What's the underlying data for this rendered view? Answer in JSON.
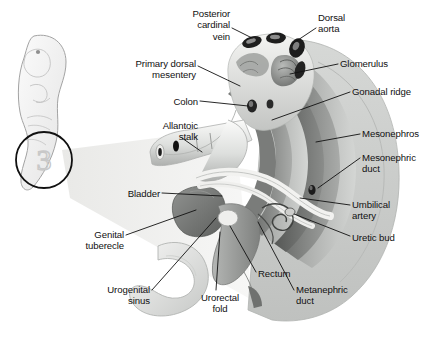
{
  "figure": {
    "background_color": "#ffffff",
    "ink_color": "#111111",
    "style": "grayscale medical illustration with leader lines"
  },
  "inset": {
    "name": "embryo-silhouette",
    "description": "whole curled embryo in pale gray, tail region circled",
    "circle_label": "3",
    "outline_color": "#9a9a9a",
    "fill_color": "#f1f1f1",
    "circle_stroke": "#111111"
  },
  "labels": [
    {
      "id": "posterior-cardinal-vein",
      "text": "Posterior\ncardinal\nvein",
      "align": "right",
      "x": 168,
      "y": 8,
      "w": 62
    },
    {
      "id": "dorsal-aorta",
      "text": "Dorsal\naorta",
      "align": "left",
      "x": 318,
      "y": 12,
      "w": 60
    },
    {
      "id": "primary-dorsal-mesentery",
      "text": "Primary dorsal\nmesentery",
      "align": "right",
      "x": 118,
      "y": 58,
      "w": 78
    },
    {
      "id": "glomerulus",
      "text": "Glomerulus",
      "align": "left",
      "x": 340,
      "y": 58,
      "w": 78
    },
    {
      "id": "gonadal-ridge",
      "text": "Gonadal ridge",
      "align": "left",
      "x": 352,
      "y": 86,
      "w": 86
    },
    {
      "id": "colon",
      "text": "Colon",
      "align": "right",
      "x": 158,
      "y": 96,
      "w": 40
    },
    {
      "id": "allantoic-stalk",
      "text": "Allantoic\nstalk",
      "align": "right",
      "x": 140,
      "y": 120,
      "w": 58
    },
    {
      "id": "mesonephros",
      "text": "Mesonephros",
      "align": "left",
      "x": 362,
      "y": 128,
      "w": 78
    },
    {
      "id": "mesonephric-duct",
      "text": "Mesonephric\nduct",
      "align": "left",
      "x": 362,
      "y": 152,
      "w": 78
    },
    {
      "id": "bladder",
      "text": "Bladder",
      "align": "right",
      "x": 110,
      "y": 188,
      "w": 50
    },
    {
      "id": "umbilical-artery",
      "text": "Umbilical\nartery",
      "align": "left",
      "x": 352,
      "y": 199,
      "w": 70
    },
    {
      "id": "genital-tuberecle",
      "text": "Genital\ntuberecle",
      "align": "right",
      "x": 58,
      "y": 229,
      "w": 66
    },
    {
      "id": "uretic-bud",
      "text": "Uretic bud",
      "align": "left",
      "x": 352,
      "y": 232,
      "w": 70
    },
    {
      "id": "rectum",
      "text": "Rectum",
      "align": "left",
      "x": 258,
      "y": 268,
      "w": 48
    },
    {
      "id": "urogenital-sinus",
      "text": "Urogenital\nsinus",
      "align": "right",
      "x": 82,
      "y": 284,
      "w": 68
    },
    {
      "id": "urorectal-fold",
      "text": "Urorectal\nfold",
      "align": "center",
      "x": 190,
      "y": 292,
      "w": 60
    },
    {
      "id": "metanephric-duct",
      "text": "Metanephric\nduct",
      "align": "left",
      "x": 296,
      "y": 284,
      "w": 76
    }
  ],
  "structures": [
    {
      "id": "body-wall",
      "name": "body-wall-outline",
      "tone": "#c9cbc9"
    },
    {
      "id": "mesonephros-bands",
      "name": "mesonephros-bands",
      "tone": "#8d8f8d"
    },
    {
      "id": "gonadal-ridge-body",
      "name": "gonadal-ridge",
      "tone": "#6f716f"
    },
    {
      "id": "dorsal-dome",
      "name": "dorsal-mesentery-dome",
      "tone": "#e8e8e6"
    },
    {
      "id": "aorta-vessels",
      "name": "dorsal-aorta-vessels",
      "tone": "#2b2b2b"
    },
    {
      "id": "gut-tube",
      "name": "colon-allantois-tube",
      "tone": "#dedede"
    },
    {
      "id": "bladder-body",
      "name": "bladder",
      "tone": "#7c7e7c"
    },
    {
      "id": "umbilical-arteries",
      "name": "umbilical-artery-cords",
      "tone": "#f4f4f2"
    },
    {
      "id": "rectum-body",
      "name": "rectum",
      "tone": "#9b9d9b"
    },
    {
      "id": "tail-hook",
      "name": "tail-genital-tubercle",
      "tone": "#e2e2e0"
    },
    {
      "id": "uretic-bud-coil",
      "name": "uretic-bud-coil",
      "tone": "#cfcfcd"
    }
  ]
}
